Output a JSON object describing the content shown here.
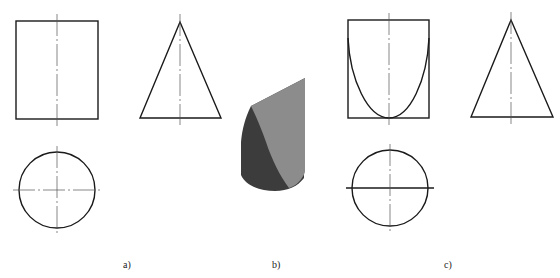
{
  "figure": {
    "panels": [
      {
        "id": "a",
        "label": "a)",
        "description": "Three-view projection of a cylinder and cone (front view rectangle, side view triangle, top view circle)",
        "views": [
          "front-rectangle",
          "side-triangle",
          "top-circle"
        ]
      },
      {
        "id": "b",
        "label": "b)",
        "description": "3D shaded rendering of a cylinder cut by an inclined plane"
      },
      {
        "id": "c",
        "label": "c)",
        "description": "Three-view projection showing the parabolic intersection curve on the front view and solid cut line on the top view",
        "views": [
          "front-rectangle-with-parabola",
          "side-triangle",
          "top-circle-with-cut-line"
        ]
      }
    ]
  },
  "colors": {
    "line": "#1a1a1a",
    "center_line": "#555555",
    "shade_dark": "#3c3c3c",
    "shade_light": "#8c8c8c",
    "background": "#ffffff"
  }
}
